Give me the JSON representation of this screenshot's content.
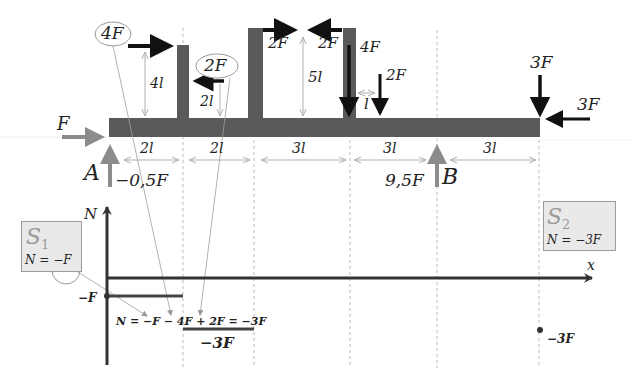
{
  "structure": {
    "left_force": {
      "label": "F"
    },
    "support_A": {
      "label": "A",
      "reaction": "−0,5F"
    },
    "support_B": {
      "label": "B",
      "reaction": "9,5F"
    },
    "post1": {
      "force": "4F",
      "height": "4l"
    },
    "post2": {
      "force": "2F",
      "height": "2l"
    },
    "post3": {
      "force_right": "2F",
      "height": "5l"
    },
    "post4": {
      "force_left": "2F",
      "force_down": "4F"
    },
    "point_load": {
      "force": "2F",
      "offset": "l"
    },
    "end_loads": {
      "vertical": "3F",
      "horizontal": "3F"
    },
    "spans": [
      "2l",
      "2l",
      "3l",
      "3l",
      "3l"
    ]
  },
  "diagram": {
    "y_axis_label": "N",
    "x_axis_label": "x",
    "left_value_label": "−F",
    "segment2_value_label": "−3F",
    "right_point_label": "−3F",
    "equation": "N = −F − 4F + 2F = −3F"
  },
  "section1": {
    "title": "S",
    "subscript": "1",
    "formula_prefix": "N =",
    "formula_value": "−F"
  },
  "section2": {
    "title": "S",
    "subscript": "2",
    "formula": "N = −3F"
  },
  "colors": {
    "beam": "#5a5a5a",
    "force_black": "#111111",
    "support_gray": "#8c8c8c",
    "dim_gray": "#a8a8a8",
    "box_fill": "#e9e9e9"
  }
}
